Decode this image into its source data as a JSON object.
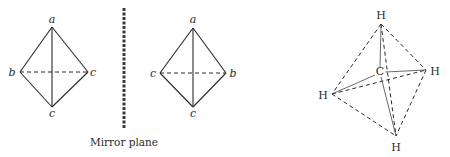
{
  "figure": {
    "left_tetrahedron": {
      "labels": {
        "top": "a",
        "left": "b",
        "right": "c",
        "bottom": "c"
      }
    },
    "mirror": {
      "caption": "Mirror plane"
    },
    "right_tetrahedron": {
      "labels": {
        "top": "a",
        "left": "c",
        "right": "b",
        "bottom": "c"
      }
    },
    "methane": {
      "center_atom": "C",
      "atoms": {
        "top": "H",
        "right": "H",
        "left": "H",
        "bottom": "H"
      }
    },
    "colors": {
      "ink": "#2a2a2a",
      "background": "#ffffff"
    }
  }
}
